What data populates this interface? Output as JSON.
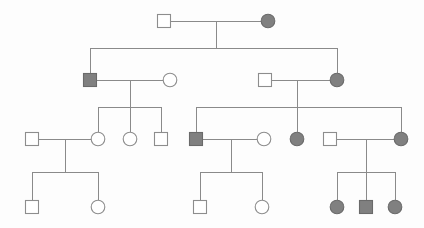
{
  "figure": {
    "kind": "pedigree-chart",
    "title": "",
    "width": 424,
    "height": 228,
    "background_color": "#fdfdfd"
  },
  "legend": {
    "square_meaning": "male",
    "circle_meaning": "female",
    "filled_meaning": "affected",
    "unfilled_meaning": "unaffected"
  },
  "colors": {
    "line": "#8a8a8a",
    "symbol_outline": "#8d8d8d",
    "affected_fill": "#808080",
    "affected_outline": "#6a6a6a",
    "unaffected_fill": "#ffffff"
  },
  "style": {
    "square_size": 13,
    "circle_radius": 6.8,
    "line_width": 1
  },
  "chart_data": {
    "type": "diagram",
    "generations": 4,
    "individuals": [
      {
        "id": "I-1",
        "generation": 1,
        "sex": "male",
        "affected": false,
        "x": 164,
        "y": 21
      },
      {
        "id": "I-2",
        "generation": 1,
        "sex": "female",
        "affected": true,
        "x": 268,
        "y": 21
      },
      {
        "id": "II-1",
        "generation": 2,
        "sex": "male",
        "affected": true,
        "x": 90,
        "y": 80
      },
      {
        "id": "II-2",
        "generation": 2,
        "sex": "female",
        "affected": false,
        "x": 170,
        "y": 80
      },
      {
        "id": "II-3",
        "generation": 2,
        "sex": "male",
        "affected": false,
        "x": 265,
        "y": 80
      },
      {
        "id": "II-4",
        "generation": 2,
        "sex": "female",
        "affected": true,
        "x": 337,
        "y": 80
      },
      {
        "id": "III-1",
        "generation": 3,
        "sex": "male",
        "affected": false,
        "x": 32,
        "y": 139
      },
      {
        "id": "III-2",
        "generation": 3,
        "sex": "female",
        "affected": false,
        "x": 98,
        "y": 139
      },
      {
        "id": "III-3",
        "generation": 3,
        "sex": "female",
        "affected": false,
        "x": 130,
        "y": 139
      },
      {
        "id": "III-4",
        "generation": 3,
        "sex": "male",
        "affected": false,
        "x": 161,
        "y": 139
      },
      {
        "id": "III-5",
        "generation": 3,
        "sex": "male",
        "affected": true,
        "x": 196,
        "y": 139
      },
      {
        "id": "III-6",
        "generation": 3,
        "sex": "female",
        "affected": false,
        "x": 264,
        "y": 139
      },
      {
        "id": "III-7",
        "generation": 3,
        "sex": "female",
        "affected": true,
        "x": 297,
        "y": 139
      },
      {
        "id": "III-8",
        "generation": 3,
        "sex": "male",
        "affected": false,
        "x": 330,
        "y": 139
      },
      {
        "id": "III-9",
        "generation": 3,
        "sex": "female",
        "affected": true,
        "x": 401,
        "y": 139
      },
      {
        "id": "IV-1",
        "generation": 4,
        "sex": "male",
        "affected": false,
        "x": 32,
        "y": 207
      },
      {
        "id": "IV-2",
        "generation": 4,
        "sex": "female",
        "affected": false,
        "x": 98,
        "y": 207
      },
      {
        "id": "IV-3",
        "generation": 4,
        "sex": "male",
        "affected": false,
        "x": 200,
        "y": 207
      },
      {
        "id": "IV-4",
        "generation": 4,
        "sex": "female",
        "affected": false,
        "x": 262,
        "y": 207
      },
      {
        "id": "IV-5",
        "generation": 4,
        "sex": "female",
        "affected": true,
        "x": 337,
        "y": 207
      },
      {
        "id": "IV-6",
        "generation": 4,
        "sex": "male",
        "affected": true,
        "x": 366,
        "y": 207
      },
      {
        "id": "IV-7",
        "generation": 4,
        "sex": "female",
        "affected": true,
        "x": 395,
        "y": 207
      }
    ],
    "matings": [
      {
        "id": "M1",
        "partners": [
          "I-1",
          "I-2"
        ],
        "mating_y": 21,
        "drop_x": 216,
        "drop_to_y": 48,
        "sibship_y": 48,
        "sibship_x1": 90,
        "sibship_x2": 337,
        "children": [
          "II-1",
          "II-4"
        ]
      },
      {
        "id": "M2",
        "partners": [
          "II-1",
          "II-2"
        ],
        "mating_y": 80,
        "drop_x": 130,
        "drop_to_y": 107,
        "sibship_y": 107,
        "sibship_x1": 98,
        "sibship_x2": 161,
        "children": [
          "III-2",
          "III-3",
          "III-4"
        ]
      },
      {
        "id": "M3",
        "partners": [
          "II-3",
          "II-4"
        ],
        "mating_y": 80,
        "drop_x": 297,
        "drop_to_y": 107,
        "sibship_y": 107,
        "sibship_x1": 196,
        "sibship_x2": 401,
        "children": [
          "III-5",
          "III-7",
          "III-9"
        ]
      },
      {
        "id": "M4",
        "partners": [
          "III-1",
          "III-2"
        ],
        "mating_y": 139,
        "drop_x": 65,
        "drop_to_y": 172,
        "sibship_y": 172,
        "sibship_x1": 32,
        "sibship_x2": 98,
        "children": [
          "IV-1",
          "IV-2"
        ]
      },
      {
        "id": "M5",
        "partners": [
          "III-5",
          "III-6"
        ],
        "mating_y": 139,
        "drop_x": 231,
        "drop_to_y": 172,
        "sibship_y": 172,
        "sibship_x1": 200,
        "sibship_x2": 262,
        "children": [
          "IV-3",
          "IV-4"
        ]
      },
      {
        "id": "M6",
        "partners": [
          "III-8",
          "III-9"
        ],
        "mating_y": 139,
        "drop_x": 366,
        "drop_to_y": 172,
        "sibship_y": 172,
        "sibship_x1": 337,
        "sibship_x2": 395,
        "children": [
          "IV-5",
          "IV-6",
          "IV-7"
        ]
      }
    ]
  }
}
